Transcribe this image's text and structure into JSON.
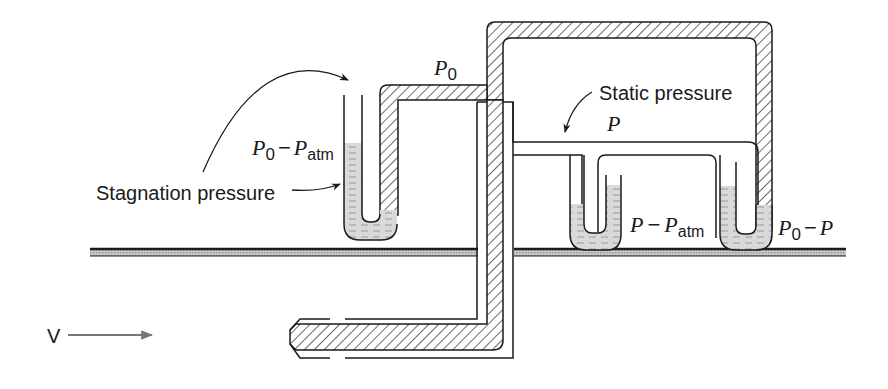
{
  "figure": {
    "type": "pitot-static tube with manometers",
    "labels": {
      "stagnation_pressure": "Stagnation pressure",
      "static_pressure": "Static pressure",
      "velocity": "V"
    },
    "symbols": {
      "p0_top": {
        "main": "P",
        "sub": "0"
      },
      "p_static": {
        "main": "P"
      },
      "left_manometer": {
        "a": "P",
        "a_sub": "0",
        "op": "−",
        "b": "P",
        "b_sub": "atm"
      },
      "middle_manometer": {
        "a": "P",
        "op": "−",
        "b": "P",
        "b_sub": "atm"
      },
      "right_manometer": {
        "a": "P",
        "a_sub": "0",
        "op": "−",
        "b": "P"
      }
    },
    "colors": {
      "line": "#1a1a1a",
      "fluid": "#d6d6d6",
      "wall": "#b8b8b8",
      "arrow_v": "#777777"
    }
  }
}
